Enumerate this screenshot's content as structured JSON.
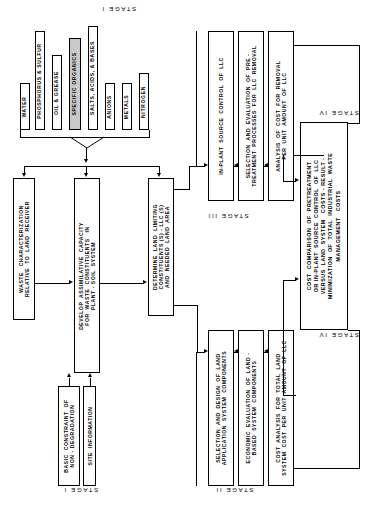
{
  "diagram": {
    "stage_labels": {
      "stage1_top": "STAGE I",
      "stage1_bottom": "STAGE I",
      "stage2_bottom": "STAGE II",
      "stage3": "STAGE III",
      "stage4_top": "STAGE IV",
      "stage4_bottom": "STAGE IV"
    },
    "constituents": {
      "group_name": "waste constituents",
      "items": [
        {
          "id": "water",
          "label": "WATER",
          "highlighted": false
        },
        {
          "id": "phosphorus-sulfur",
          "label": "PHOSPHORUS & SULFUR",
          "highlighted": false
        },
        {
          "id": "oil-grease",
          "label": "OIL & GREASE",
          "highlighted": false
        },
        {
          "id": "specific-organics",
          "label": "SPECIFIC ORGANICS",
          "highlighted": true
        },
        {
          "id": "salts-acids-bases",
          "label": "SALTS, ACIDS, & BASES",
          "highlighted": false
        },
        {
          "id": "anions",
          "label": "ANIONS",
          "highlighted": false
        },
        {
          "id": "metals",
          "label": "METALS",
          "highlighted": false
        },
        {
          "id": "nitrogen",
          "label": "NITROGEN",
          "highlighted": false
        }
      ]
    },
    "stage1_boxes": [
      {
        "id": "waste-characterization",
        "label": "WASTE   CHARACTERIZATION\nRELATIVE  TO  LAND  RECEIVER"
      },
      {
        "id": "assimilative-capacity",
        "label": "DEVELOP  ASSIMILATIVE  CAPACITY\nFOR  WASTE  CONSTITUENTS   IN\nPLANT - SOIL  SYSTEM"
      },
      {
        "id": "land-limiting-constituent",
        "label": "DETERMINE  LAND  LIMITING\nCONSTITUENTS (S) - LLC (S)\nAND  NEEDED  LAND  AREA"
      }
    ],
    "stage1_inputs": [
      {
        "id": "non-degradation-constraint",
        "label": "BASIC  CONSTRAINT  OF\nNON - DEGRADATION"
      },
      {
        "id": "site-information",
        "label": "SITE  INFORMATION"
      }
    ],
    "stage2_boxes": [
      {
        "id": "selection-design-land-application",
        "label": "SELECTION  AND  DESIGN  OF  LAND\nAPPLICATION  SYSTEM  COMPONENTS"
      },
      {
        "id": "economic-evaluation",
        "label": "ECONOMIC  EVALUATION  OF  LAND -\nBASED  SYSTEM  COMPONENTS"
      },
      {
        "id": "cost-analysis-total-land",
        "label": "COST  ANALYSIS  FOR  TOTAL  LAND\nSYSTEM  COST  PER  UNIT  AMOUNT  OF  LLC"
      }
    ],
    "stage3_boxes": [
      {
        "id": "in-plant-source-control",
        "label": "IN-PLANT  SOURCE  CONTROL  OF  LLC"
      },
      {
        "id": "pretreatment-selection",
        "label": "SELECTION  AND  EVALUATION  OF  PRE -\nTREATMENT  PROCESSES  FOR  LLC  REMOVAL"
      },
      {
        "id": "cost-removal-analysis",
        "label": "ANALYSIS  OF  COST  FOR  REMOVAL\nPER  UNIT  AMOUNT  OF  LLC"
      }
    ],
    "stage4_box": {
      "id": "cost-comparison",
      "label": "COST  COMPARISON  OF  PRETREATMENT\nOR IN-PLANT  SOURCE  CONTROL  OF  LLC\nVERSUS  LAND  SYSTEM   COSTS - RESULT -\nMINIMIZATION  OF  TOTAL  INDUSTRIAL  WASTE\nMANAGEMENT   COSTS"
    },
    "colors": {
      "line": "#000000",
      "background": "#ffffff",
      "highlight_fill": "#c9c9c9"
    }
  }
}
